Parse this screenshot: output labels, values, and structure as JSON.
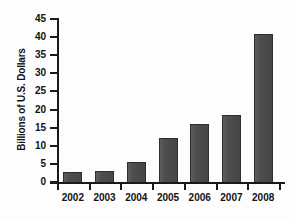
{
  "chart_data": {
    "type": "bar",
    "title": "",
    "subtitle": "",
    "xlabel": "",
    "ylabel": "Billions of U.S. Dollars",
    "categories": [
      "2002",
      "2003",
      "2004",
      "2005",
      "2006",
      "2007",
      "2008"
    ],
    "values": [
      2.8,
      2.9,
      5.5,
      12.2,
      16.0,
      18.6,
      40.8
    ],
    "series": [
      {
        "name": "Billions of U.S. Dollars",
        "values": [
          2.8,
          2.9,
          5.5,
          12.2,
          16.0,
          18.6,
          40.8
        ]
      }
    ],
    "ylim": [
      0,
      45
    ],
    "ytick_labels": [
      "0",
      "5",
      "10",
      "15",
      "20",
      "25",
      "30",
      "35",
      "40",
      "45"
    ],
    "ytick_values": [
      0,
      5,
      10,
      15,
      20,
      25,
      30,
      35,
      40,
      45
    ],
    "ytick_interval": 5,
    "xtick_labels": [
      "2002",
      "2003",
      "2004",
      "2005",
      "2006",
      "2007",
      "2008"
    ],
    "grid": false,
    "legend": false,
    "legend_position": "none",
    "bar_color": "#4a4a4a",
    "bar_edge_color": "#2e2e2e",
    "axis_color": "#1a1a1a",
    "text_color": "#121212",
    "background_color": "#fdfdfd"
  }
}
